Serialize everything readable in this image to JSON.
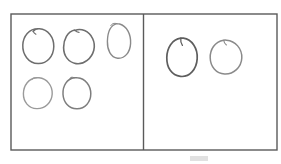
{
  "image": {
    "title": "Two-panel hand-drawn circle grouping worksheet",
    "background_color": "#ffffff",
    "width": 281,
    "height": 164
  },
  "frame": {
    "name": "outer-frame",
    "x": 11,
    "y": 14,
    "width": 266,
    "height": 136,
    "stroke_color": "#5a5a5a",
    "stroke_width": 1.4,
    "fill_color": "#ffffff"
  },
  "divider": {
    "name": "vertical-divider",
    "x": 143.5,
    "y_top": 14,
    "y_bottom": 150,
    "stroke_color": "#5a5a5a",
    "stroke_width": 1.4
  },
  "panels": [
    {
      "id": "left-panel",
      "label": "Left group",
      "circle_count": 5,
      "x": 11,
      "y": 14,
      "width": 132.5,
      "height": 136
    },
    {
      "id": "right-panel",
      "label": "Right group",
      "circle_count": 2,
      "x": 143.5,
      "y": 14,
      "width": 133.5,
      "height": 136
    }
  ],
  "circles": [
    {
      "id": "left-circle-1",
      "panel": "left-panel",
      "row": 1,
      "col": 1,
      "cx": 38,
      "cy": 46,
      "rx": 15.5,
      "ry": 17.5,
      "rotation": -6,
      "stroke_color": "#6e6e6e",
      "stroke_width": 1.5,
      "path": "M 38.5 28.8 C 29.0 28.6 23.2 36.0 22.8 45.0 C 22.4 54.4 28.4 63.2 38.0 63.6 C 47.2 64.0 53.6 56.2 53.8 46.6 C 54.0 37.4 48.2 29.4 39.4 28.8 C 36.6 28.6 34.6 29.6 33.2 31.4",
      "tail": "M 33.2 31.4 C 33.9 32.8 34.8 33.7 35.9 34.3"
    },
    {
      "id": "left-circle-2",
      "panel": "left-panel",
      "row": 1,
      "col": 2,
      "cx": 79,
      "cy": 46,
      "rx": 15.5,
      "ry": 17,
      "rotation": 8,
      "stroke_color": "#6e6e6e",
      "stroke_width": 1.6,
      "path": "M 74.6 30.0 C 67.4 31.6 63.6 39.4 63.6 47.4 C 63.6 55.6 68.4 62.4 76.0 63.6 C 84.2 64.8 91.6 58.4 93.8 50.2 C 95.8 42.6 92.0 33.8 84.6 30.6 C 81.0 29.0 77.8 29.2 75.0 30.4",
      "tail": "M 75.0 30.4 C 76.2 31.6 77.6 32.2 79.0 32.4"
    },
    {
      "id": "left-circle-3",
      "panel": "left-panel",
      "row": 1,
      "col": 3,
      "cx": 119,
      "cy": 41,
      "rx": 12,
      "ry": 17,
      "rotation": -3,
      "stroke_color": "#8a8a8a",
      "stroke_width": 1.4,
      "path": "M 117.0 23.6 C 110.4 25.2 107.6 32.8 107.4 41.2 C 107.2 49.8 110.6 57.4 117.6 58.2 C 124.8 59.0 130.2 52.2 130.6 43.4 C 131.0 34.6 127.0 26.0 119.6 24.0 C 118.4 23.7 117.6 23.6 117.0 23.6",
      "tail": "M 117.0 23.6 C 113.8 22.8 111.8 23.6 110.8 25.6"
    },
    {
      "id": "left-circle-4",
      "panel": "left-panel",
      "row": 2,
      "col": 1,
      "cx": 38,
      "cy": 93,
      "rx": 14.5,
      "ry": 15.5,
      "rotation": 4,
      "stroke_color": "#9a9a9a",
      "stroke_width": 1.4,
      "path": "M 36.4 77.8 C 28.4 78.6 23.6 85.6 23.4 93.6 C 23.2 101.8 28.6 108.4 36.8 108.6 C 45.2 108.8 51.8 102.2 52.2 94.0 C 52.6 85.8 47.0 78.6 39.0 77.8 C 38.0 77.7 37.2 77.7 36.4 77.8",
      "tail": "M 36.4 77.8 C 34.2 77.4 32.6 78.2 31.8 79.8"
    },
    {
      "id": "left-circle-5",
      "panel": "left-panel",
      "row": 2,
      "col": 2,
      "cx": 77,
      "cy": 93,
      "rx": 14,
      "ry": 15.5,
      "rotation": -5,
      "stroke_color": "#7e7e7e",
      "stroke_width": 1.5,
      "path": "M 74.6 77.8 C 66.6 78.8 62.6 86.2 63.0 94.2 C 63.4 102.2 68.8 108.6 76.8 108.8 C 85.0 109.0 90.8 102.0 90.8 93.8 C 90.8 85.6 85.4 78.4 77.4 77.8 C 76.4 77.7 75.4 77.7 74.6 77.8",
      "tail": "M 74.6 77.8 C 72.2 76.6 70.6 77.2 69.8 79.2"
    },
    {
      "id": "right-circle-1",
      "panel": "right-panel",
      "row": 1,
      "col": 1,
      "cx": 182,
      "cy": 57,
      "rx": 15.5,
      "ry": 19,
      "rotation": 5,
      "stroke_color": "#5e5e5e",
      "stroke_width": 1.7,
      "path": "M 180.8 38.2 C 172.0 39.4 167.0 47.8 166.8 57.4 C 166.6 67.6 171.6 75.4 180.4 76.4 C 189.6 77.4 196.6 69.2 197.2 58.6 C 197.8 48.2 192.0 39.4 183.4 38.2 C 182.6 38.1 181.6 38.1 180.8 38.2",
      "tail": "M 180.8 38.2 C 180.4 41.0 181.0 43.4 182.4 45.4"
    },
    {
      "id": "right-circle-2",
      "panel": "right-panel",
      "row": 1,
      "col": 2,
      "cx": 226,
      "cy": 57,
      "rx": 16,
      "ry": 17,
      "rotation": -4,
      "stroke_color": "#8a8a8a",
      "stroke_width": 1.5,
      "path": "M 223.6 40.2 C 214.6 41.8 210.0 49.4 210.2 57.8 C 210.4 66.6 216.0 73.6 224.6 74.0 C 233.6 74.4 241.4 67.2 241.8 58.0 C 242.2 48.6 235.4 41.0 226.6 40.2 C 225.6 40.1 224.4 40.1 223.6 40.2",
      "tail": "M 223.6 40.2 C 224.0 42.4 225.0 44.0 226.4 45.0"
    }
  ],
  "artifacts": [
    {
      "id": "bottom-smudge",
      "name": "faint-smudge-mark",
      "x": 190,
      "y": 156,
      "width": 18,
      "height": 5,
      "color": "#c9c9c9",
      "description": "Faint gray smudge below the frame"
    }
  ]
}
